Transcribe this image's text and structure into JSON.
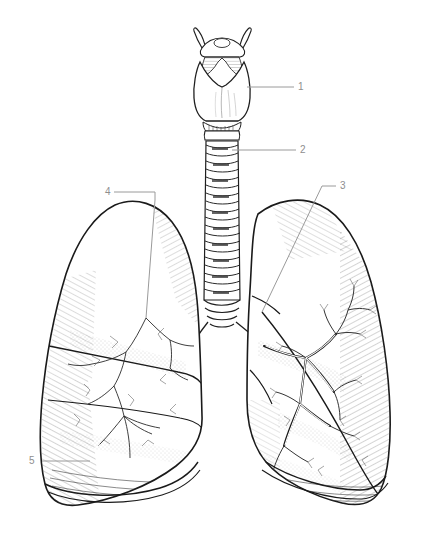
{
  "figure": {
    "background_color": "#ffffff",
    "ink_color": "#1a1a1a",
    "leader_color": "#9a9a9a",
    "label_color": "#8e8e8e",
    "width": 435,
    "height": 547
  },
  "labels": [
    {
      "id": "label-1",
      "text": "1",
      "x": 298,
      "y": 82,
      "target": "larynx",
      "leader": {
        "type": "horizontal",
        "x1": 247,
        "y1": 87,
        "x2": 294,
        "y2": 87
      }
    },
    {
      "id": "label-2",
      "text": "2",
      "x": 300,
      "y": 145,
      "target": "trachea",
      "leader": {
        "type": "horizontal",
        "x1": 232,
        "y1": 150,
        "x2": 296,
        "y2": 150
      }
    },
    {
      "id": "label-3",
      "text": "3",
      "x": 340,
      "y": 181,
      "target": "right-lung-upper-lobe",
      "leader": {
        "type": "diagonal",
        "x1": 262,
        "y1": 312,
        "x2": 322,
        "y2": 186,
        "x3": 336,
        "y3": 186
      }
    },
    {
      "id": "label-4",
      "text": "4",
      "x": 105,
      "y": 187,
      "target": "left-lung-upper-lobe",
      "leader": {
        "type": "elbow",
        "x1": 114,
        "y1": 192,
        "x2": 155,
        "y2": 192,
        "x3": 155,
        "y3": 200,
        "x4": 146,
        "y4": 318
      }
    },
    {
      "id": "label-5",
      "text": "5",
      "x": 29,
      "y": 456,
      "target": "left-lung-lower-lobe",
      "leader": {
        "type": "horizontal",
        "x1": 42,
        "y1": 461,
        "x2": 90,
        "y2": 461
      }
    }
  ],
  "structures": [
    {
      "name": "hyoid-bone",
      "label_ref": null
    },
    {
      "name": "larynx",
      "label_ref": "1"
    },
    {
      "name": "trachea",
      "label_ref": "2",
      "ring_count": 18
    },
    {
      "name": "carina",
      "label_ref": null
    },
    {
      "name": "right-lung",
      "label_ref": "3",
      "lobes": 2
    },
    {
      "name": "left-lung",
      "label_ref": "4",
      "lobes": 3
    },
    {
      "name": "left-lung-base",
      "label_ref": "5"
    },
    {
      "name": "bronchial-tree",
      "label_ref": null
    }
  ]
}
